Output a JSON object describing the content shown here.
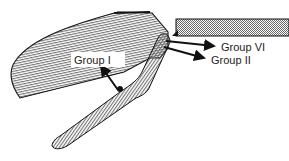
{
  "diagram": {
    "labels": {
      "group1": "Group I",
      "group6": "Group VI",
      "group2": "Group II"
    },
    "parts": [
      "upper-blade",
      "lower-jaw",
      "fixed-plate"
    ],
    "colors": {
      "stroke": "#111111",
      "hatch": "#444444",
      "background": "#ffffff",
      "label_bg": "#ffffff"
    }
  }
}
